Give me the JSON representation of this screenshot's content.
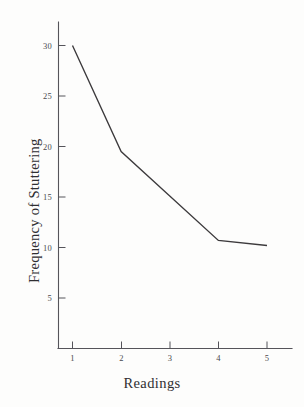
{
  "chart_data": {
    "type": "line",
    "title": "",
    "xlabel": "Readings",
    "ylabel": "Frequency of Stuttering",
    "x": [
      1,
      2,
      3,
      4,
      5
    ],
    "categories": [
      "1",
      "2",
      "3",
      "4",
      "5"
    ],
    "values": [
      30.0,
      19.5,
      15.1,
      10.7,
      10.2
    ],
    "series": [
      {
        "name": "Frequency of Stuttering",
        "values": [
          30.0,
          19.5,
          15.1,
          10.7,
          10.2
        ]
      }
    ],
    "xlim": [
      0.6,
      5.4
    ],
    "ylim": [
      0,
      31.5
    ],
    "xticks": [
      "1",
      "2",
      "3",
      "4",
      "5"
    ],
    "yticks": [
      "5",
      "10",
      "15",
      "20",
      "25",
      "30"
    ],
    "grid": false,
    "legend": false,
    "legend_position": "none",
    "line_color": "#3c3a3c",
    "axis_color": "#55545a",
    "background_color": "#fdfdfc",
    "markers": false
  },
  "axes": {
    "y_title": "Frequency of Stuttering",
    "x_title": "Readings",
    "y_tick_labels": [
      "30",
      "25",
      "20",
      "15",
      "10",
      "5"
    ],
    "x_tick_labels": [
      "1",
      "2",
      "3",
      "4",
      "5"
    ]
  }
}
